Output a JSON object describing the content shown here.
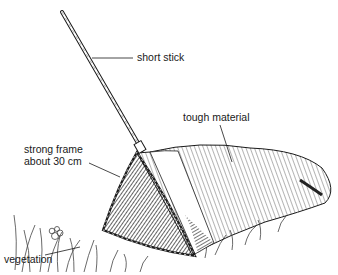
{
  "diagram": {
    "labels": [
      {
        "id": "short-stick",
        "text": "short stick"
      },
      {
        "id": "tough-material",
        "text": "tough material"
      },
      {
        "id": "strong-frame",
        "line1": "strong frame",
        "line2": "about 30 cm"
      },
      {
        "id": "vegetation",
        "text": "vegetation"
      }
    ],
    "colors": {
      "ink": "#1a1a1a",
      "background": "#ffffff",
      "hatch": "#333333"
    }
  }
}
